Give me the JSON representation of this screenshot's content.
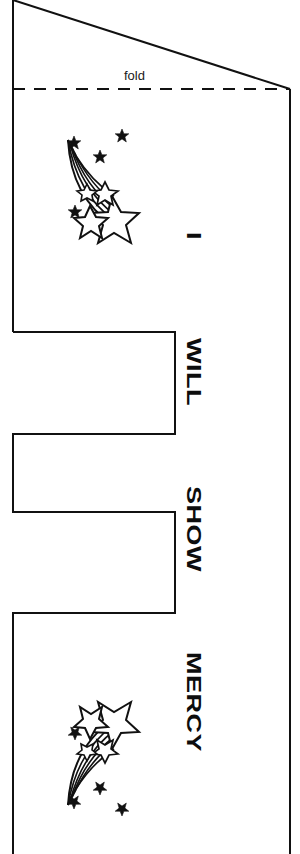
{
  "page": {
    "kind": "printable-craft-template",
    "background_color": "#ffffff",
    "ink_color": "#111111",
    "width": 300,
    "height": 854
  },
  "heading": {
    "line1": "A ",
    "line2": "ABOU",
    "note_clipped": "text runs off the right edge of the page"
  },
  "fold": {
    "label": "fold",
    "line_style": "dashed"
  },
  "strip_words": [
    {
      "id": "word-i",
      "text": "I"
    },
    {
      "id": "word-will",
      "text": "WILL"
    },
    {
      "id": "word-show",
      "text": "SHOW"
    },
    {
      "id": "word-mercy",
      "text": "MERCY"
    }
  ],
  "illustrations": [
    {
      "id": "shooting-star-top",
      "name": "shooting-star"
    },
    {
      "id": "shooting-star-bottom",
      "name": "shooting-star"
    }
  ],
  "outline": {
    "left_edge_x": 13,
    "right_edge_x": 290,
    "fold_y": 89,
    "notch_right_x": 175,
    "notch_steps_y": [
      332,
      434,
      512,
      613
    ]
  }
}
